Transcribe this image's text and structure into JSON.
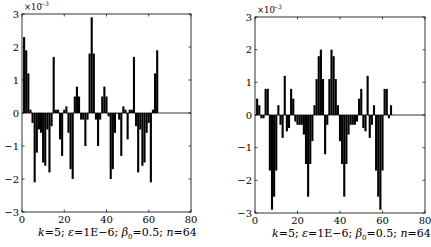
{
  "chart_data": [
    {
      "type": "bar",
      "title": "",
      "xlabel": "k=5; ε=1E−6; β0=0.5; n=64",
      "ylabel": "",
      "y_multiplier": "×10^-3",
      "xlim": [
        0,
        80
      ],
      "ylim": [
        -3,
        3
      ],
      "xticks": [
        0,
        20,
        40,
        60,
        80
      ],
      "yticks": [
        -3,
        -2,
        -1,
        0,
        1,
        2,
        3
      ],
      "grid": false,
      "x": [
        1,
        2,
        3,
        4,
        5,
        6,
        7,
        8,
        9,
        10,
        11,
        12,
        13,
        14,
        15,
        16,
        17,
        18,
        19,
        20,
        21,
        22,
        23,
        24,
        25,
        26,
        27,
        28,
        29,
        30,
        31,
        32,
        33,
        34,
        35,
        36,
        37,
        38,
        39,
        40,
        41,
        42,
        43,
        44,
        45,
        46,
        47,
        48,
        49,
        50,
        51,
        52,
        53,
        54,
        55,
        56,
        57,
        58,
        59,
        60,
        61,
        62,
        63,
        64
      ],
      "values": [
        2.3,
        1.9,
        1.2,
        0.1,
        -0.3,
        -2.1,
        -1.2,
        -0.5,
        -0.6,
        -1.5,
        -1.6,
        -0.5,
        -1.8,
        -0.4,
        1.7,
        0.1,
        0.1,
        -0.8,
        -1.3,
        0.1,
        0.2,
        -0.6,
        -1.7,
        -2.0,
        0.5,
        0.8,
        0.5,
        -0.2,
        -0.2,
        -1.0,
        -0.2,
        1.8,
        2.9,
        1.8,
        -0.2,
        -1.0,
        -0.2,
        0.5,
        0.8,
        0.5,
        -0.1,
        -2.0,
        -1.7,
        -0.6,
        0.0,
        -0.2,
        -1.3,
        0.2,
        0.1,
        -0.8,
        0.1,
        0.1,
        1.7,
        -0.4,
        -1.8,
        -0.5,
        -1.6,
        -1.5,
        -0.6,
        -0.3,
        -2.1,
        0.1,
        1.2,
        1.9
      ]
    },
    {
      "type": "bar",
      "title": "",
      "xlabel": "k=5; ε=1E−6; β0=0.5; n=64",
      "ylabel": "",
      "y_multiplier": "×10^-3",
      "xlim": [
        0,
        80
      ],
      "ylim": [
        -3,
        3
      ],
      "xticks": [
        0,
        20,
        40,
        60,
        80
      ],
      "yticks": [
        -3,
        -2,
        -1,
        0,
        1,
        2,
        3
      ],
      "grid": false,
      "x": [
        1,
        2,
        3,
        4,
        5,
        6,
        7,
        8,
        9,
        10,
        11,
        12,
        13,
        14,
        15,
        16,
        17,
        18,
        19,
        20,
        21,
        22,
        23,
        24,
        25,
        26,
        27,
        28,
        29,
        30,
        31,
        32,
        33,
        34,
        35,
        36,
        37,
        38,
        39,
        40,
        41,
        42,
        43,
        44,
        45,
        46,
        47,
        48,
        49,
        50,
        51,
        52,
        53,
        54,
        55,
        56,
        57,
        58,
        59,
        60,
        61,
        62,
        63,
        64
      ],
      "values": [
        0.5,
        0.3,
        -0.1,
        -0.1,
        0.8,
        0.8,
        -1.7,
        -2.9,
        -2.5,
        -1.7,
        0.3,
        -0.3,
        -0.7,
        1.2,
        -0.5,
        -0.4,
        0.8,
        0.5,
        -0.2,
        -0.3,
        -0.3,
        -0.3,
        -0.6,
        -1.5,
        -2.5,
        -1.5,
        -0.8,
        0.3,
        1.1,
        1.8,
        2.0,
        1.1,
        -1.2,
        -0.3,
        1.1,
        2.0,
        1.8,
        1.1,
        0.3,
        -0.8,
        -1.5,
        -2.5,
        -1.5,
        -0.6,
        -0.3,
        -0.3,
        -0.3,
        -0.2,
        0.5,
        0.8,
        -0.4,
        -0.5,
        1.2,
        -0.7,
        -0.3,
        0.3,
        -1.7,
        -2.5,
        -2.9,
        -1.7,
        0.8,
        0.8,
        -0.1,
        0.3
      ]
    }
  ],
  "panels": [
    {
      "multiplier_label": "×10",
      "multiplier_exp": "−3",
      "ytick_labels": [
        "3",
        "2",
        "1",
        "0",
        "−1",
        "−2",
        "−3"
      ],
      "xtick_labels": [
        "0",
        "20",
        "40",
        "60",
        "80"
      ],
      "caption": {
        "k": "k",
        "k_val": "=5; ",
        "eps": "ε",
        "eps_val": "=1E−6; ",
        "beta": "β",
        "beta_sub": "0",
        "beta_val": "=0.5; ",
        "n": "n",
        "n_val": "=64"
      }
    },
    {
      "multiplier_label": "×10",
      "multiplier_exp": "−3",
      "ytick_labels": [
        "3",
        "2",
        "1",
        "0",
        "−1",
        "−2",
        "−3"
      ],
      "xtick_labels": [
        "0",
        "20",
        "40",
        "60",
        "80"
      ],
      "caption": {
        "k": "k",
        "k_val": "=5; ",
        "eps": "ε",
        "eps_val": "=1E−6; ",
        "beta": "β",
        "beta_sub": "0",
        "beta_val": "=0.5; ",
        "n": "n",
        "n_val": "=64"
      }
    }
  ]
}
